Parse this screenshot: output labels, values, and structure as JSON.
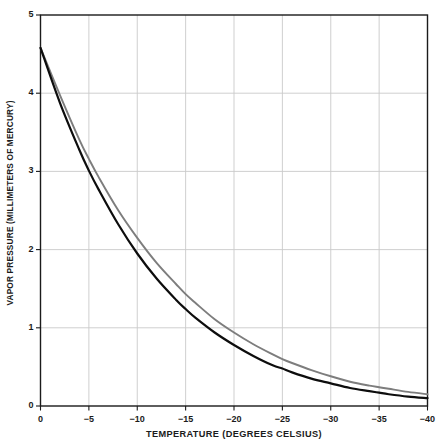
{
  "figure": {
    "background_color": "#ffffff",
    "frame_color": "#1b1b1b",
    "grid_color": "#c9c9c9"
  },
  "axes": {
    "y_title": "VAPOR PRESSURE (MILLIMETERS OF MERCURY)",
    "x_title": "TEMPERATURE (DEGREES CELSIUS)",
    "y_tick_labels": [
      "0",
      "1",
      "2",
      "3",
      "4",
      "5"
    ],
    "x_tick_labels": [
      "0",
      "−5",
      "−10",
      "−15",
      "−20",
      "−25",
      "−30",
      "−35",
      "−40"
    ]
  },
  "chart_data": {
    "type": "line",
    "title": "",
    "xlabel": "TEMPERATURE (DEGREES CELSIUS)",
    "ylabel": "VAPOR PRESSURE (MILLIMETERS OF MERCURY)",
    "xlim": [
      0,
      -40
    ],
    "ylim": [
      0,
      5
    ],
    "x_ticks": [
      0,
      -5,
      -10,
      -15,
      -20,
      -25,
      -30,
      -35,
      -40
    ],
    "y_ticks": [
      0,
      1,
      2,
      3,
      4,
      5
    ],
    "grid": true,
    "legend": "none",
    "x": [
      0,
      -2,
      -4,
      -5,
      -6,
      -8,
      -10,
      -12,
      -14,
      -15,
      -16,
      -18,
      -20,
      -22,
      -24,
      -25,
      -26,
      -28,
      -30,
      -32,
      -34,
      -35,
      -36,
      -38,
      -40
    ],
    "series": [
      {
        "name": "supercooled-water-curve",
        "color": "#7d7d7d",
        "line_width": 1.9,
        "values": [
          4.58,
          3.98,
          3.41,
          3.16,
          2.93,
          2.51,
          2.15,
          1.83,
          1.56,
          1.43,
          1.32,
          1.11,
          0.94,
          0.79,
          0.66,
          0.6,
          0.55,
          0.46,
          0.38,
          0.31,
          0.26,
          0.24,
          0.22,
          0.18,
          0.15
        ]
      },
      {
        "name": "ice-curve",
        "color": "#0d0d0d",
        "line_width": 2.2,
        "values": [
          4.58,
          3.88,
          3.28,
          3.01,
          2.77,
          2.33,
          1.95,
          1.63,
          1.36,
          1.24,
          1.13,
          0.94,
          0.78,
          0.64,
          0.52,
          0.48,
          0.43,
          0.35,
          0.29,
          0.23,
          0.19,
          0.17,
          0.15,
          0.12,
          0.1
        ]
      }
    ]
  }
}
